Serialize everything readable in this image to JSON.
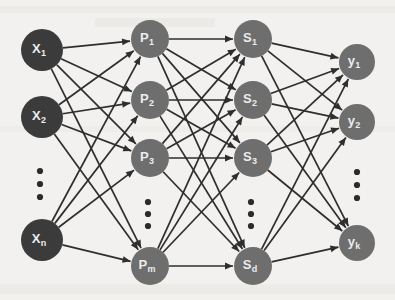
{
  "diagram": {
    "background_color": "#f2f1ef",
    "input_node_color": "#3b3b3b",
    "hidden_node_color": "#6e6e6e",
    "edge_color": "#2e2e2e",
    "label_color": "#ececec",
    "layers": [
      {
        "name": "input-layer",
        "key": "x",
        "x": 42,
        "radius": 21,
        "color": "#3b3b3b",
        "nodes": [
          {
            "base": "X",
            "sub": "1",
            "label": "X1",
            "cx": 42,
            "cy": 50,
            "r": 21
          },
          {
            "base": "X",
            "sub": "2",
            "label": "X2",
            "cx": 42,
            "cy": 117,
            "r": 21
          },
          {
            "base": "X",
            "sub": "n",
            "label": "Xn",
            "cx": 42,
            "cy": 240,
            "r": 21
          }
        ],
        "ellipsis": {
          "cx": 40,
          "dots": [
            171,
            184,
            197
          ]
        }
      },
      {
        "name": "p-layer",
        "key": "p",
        "x": 150,
        "radius": 19,
        "color": "#6e6e6e",
        "nodes": [
          {
            "base": "P",
            "sub": "1",
            "label": "P1",
            "cx": 150,
            "cy": 39,
            "r": 19
          },
          {
            "base": "P",
            "sub": "2",
            "label": "P2",
            "cx": 150,
            "cy": 100,
            "r": 19
          },
          {
            "base": "P",
            "sub": "3",
            "label": "P3",
            "cx": 150,
            "cy": 158,
            "r": 19
          },
          {
            "base": "P",
            "sub": "m",
            "label": "Pm",
            "cx": 150,
            "cy": 266,
            "r": 19
          }
        ],
        "ellipsis": {
          "cx": 148,
          "dots": [
            202,
            214,
            226
          ]
        }
      },
      {
        "name": "s-layer",
        "key": "s",
        "x": 253,
        "radius": 19,
        "color": "#6e6e6e",
        "nodes": [
          {
            "base": "S",
            "sub": "1",
            "label": "S1",
            "cx": 253,
            "cy": 39,
            "r": 19
          },
          {
            "base": "S",
            "sub": "2",
            "label": "S2",
            "cx": 253,
            "cy": 100,
            "r": 19
          },
          {
            "base": "S",
            "sub": "3",
            "label": "S3",
            "cx": 253,
            "cy": 158,
            "r": 19
          },
          {
            "base": "S",
            "sub": "d",
            "label": "Sd",
            "cx": 253,
            "cy": 266,
            "r": 19
          }
        ],
        "ellipsis": {
          "cx": 251,
          "dots": [
            202,
            214,
            226
          ]
        }
      },
      {
        "name": "output-layer",
        "key": "y",
        "x": 357,
        "radius": 18,
        "color": "#6e6e6e",
        "nodes": [
          {
            "base": "y",
            "sub": "1",
            "label": "y1",
            "cx": 357,
            "cy": 62,
            "r": 18
          },
          {
            "base": "y",
            "sub": "2",
            "label": "y2",
            "cx": 357,
            "cy": 122,
            "r": 18
          },
          {
            "base": "y",
            "sub": "k",
            "label": "yk",
            "cx": 357,
            "cy": 243,
            "r": 18
          }
        ],
        "ellipsis": {
          "cx": 357,
          "dots": [
            172,
            185,
            198
          ]
        }
      }
    ],
    "connections": [
      {
        "name": "input-to-p",
        "from": "input-layer",
        "to": "p-layer"
      },
      {
        "name": "p-to-s",
        "from": "p-layer",
        "to": "s-layer"
      },
      {
        "name": "s-to-output",
        "from": "s-layer",
        "to": "output-layer"
      }
    ]
  }
}
